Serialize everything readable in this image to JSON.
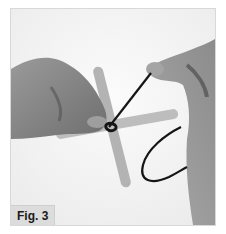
{
  "figure": {
    "label": "Fig. 3"
  },
  "colors": {
    "background": "#ffffff",
    "photo_bg": "#f6f6f6",
    "skin": "#8a8a8a",
    "stick": "#b0b0b0",
    "cord": "#1a1a1a",
    "label_bg": "#dcdcdc"
  }
}
